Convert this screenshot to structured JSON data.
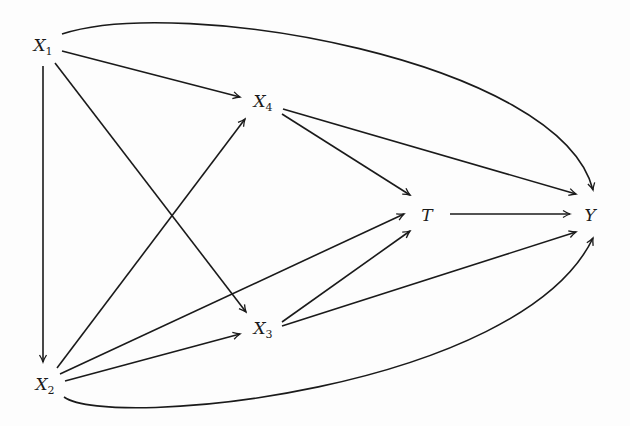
{
  "diagram": {
    "type": "causal-dag",
    "colors": {
      "edge": "#1a1a1a",
      "background": "#fdfdfd"
    },
    "nodes": [
      {
        "id": "X1",
        "base": "X",
        "sub": "1",
        "x": 43,
        "y": 47
      },
      {
        "id": "X2",
        "base": "X",
        "sub": "2",
        "x": 45,
        "y": 386
      },
      {
        "id": "X3",
        "base": "X",
        "sub": "3",
        "x": 263,
        "y": 330
      },
      {
        "id": "X4",
        "base": "X",
        "sub": "4",
        "x": 263,
        "y": 103
      },
      {
        "id": "T",
        "base": "T",
        "sub": "",
        "x": 427,
        "y": 215
      },
      {
        "id": "Y",
        "base": "Y",
        "sub": "",
        "x": 590,
        "y": 215
      }
    ],
    "edges": [
      {
        "from": "X1",
        "to": "X4",
        "curved": false
      },
      {
        "from": "X1",
        "to": "X2",
        "curved": false
      },
      {
        "from": "X1",
        "to": "X3",
        "curved": false
      },
      {
        "from": "X1",
        "to": "Y",
        "curved": true
      },
      {
        "from": "X2",
        "to": "X4",
        "curved": false
      },
      {
        "from": "X2",
        "to": "T",
        "curved": false
      },
      {
        "from": "X2",
        "to": "X3",
        "curved": false
      },
      {
        "from": "X2",
        "to": "Y",
        "curved": true
      },
      {
        "from": "X4",
        "to": "T",
        "curved": false
      },
      {
        "from": "X4",
        "to": "Y",
        "curved": false
      },
      {
        "from": "X3",
        "to": "T",
        "curved": false
      },
      {
        "from": "X3",
        "to": "Y",
        "curved": false
      },
      {
        "from": "T",
        "to": "Y",
        "curved": false
      }
    ]
  },
  "labels": {
    "X1": {
      "base": "X",
      "sub": "1"
    },
    "X2": {
      "base": "X",
      "sub": "2"
    },
    "X3": {
      "base": "X",
      "sub": "3"
    },
    "X4": {
      "base": "X",
      "sub": "4"
    },
    "T": {
      "base": "T"
    },
    "Y": {
      "base": "Y"
    }
  }
}
